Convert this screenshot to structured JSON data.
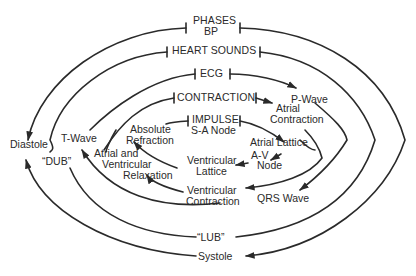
{
  "diagram": {
    "colors": {
      "stroke": "#2a2a2a",
      "text": "#2a2a2a",
      "background": "#ffffff"
    },
    "rings": [
      {
        "level": 1,
        "label": "PHASES",
        "sublabel": "BP",
        "left_end": "Diastole",
        "right_end": "Systole"
      },
      {
        "level": 2,
        "label": "HEART SOUNDS",
        "left_end": "\"DUB\"",
        "right_end": "\"LUB\""
      },
      {
        "level": 3,
        "label": "ECG",
        "right_top": "P-Wave",
        "right_bottom": "QRS Wave",
        "left_end": "T-Wave"
      },
      {
        "level": 4,
        "label": "CONTRACTION",
        "right_top": "Atrial Contraction",
        "right_bottom": "Ventricular Contraction",
        "left_end": "Atrial and Ventricular Relaxation"
      },
      {
        "level": 5,
        "label": "IMPULSE",
        "sublabel": "S-A Node",
        "steps": [
          "Atrial Lattice",
          "A-V Node",
          "Ventricular Lattice",
          "Absolute Refraction"
        ]
      }
    ],
    "labels": {
      "phases": "PHASES",
      "bp": "BP",
      "heart_sounds": "HEART SOUNDS",
      "ecg": "ECG",
      "contraction": "CONTRACTION",
      "impulse": "IMPULSE",
      "sa_node": "S-A Node",
      "p_wave": "P-Wave",
      "atrial": "Atrial",
      "contraction_word": "Contraction",
      "atrial_lattice": "Atrial Lattice",
      "av": "A-V",
      "node": "Node",
      "ventricular": "Ventricular",
      "lattice": "Lattice",
      "ventricular_c": "Ventricular",
      "contraction_c": "Contraction",
      "qrs_wave": "QRS Wave",
      "absolute": "Absolute",
      "refraction": "Refraction",
      "atrial_and": "Atrial and",
      "ventricular_r": "Ventricular",
      "relaxation": "Relaxation",
      "t_wave": "T-Wave",
      "diastole": "Diastole",
      "dub": "“DUB”",
      "lub": "“LUB”",
      "systole": "Systole"
    }
  }
}
